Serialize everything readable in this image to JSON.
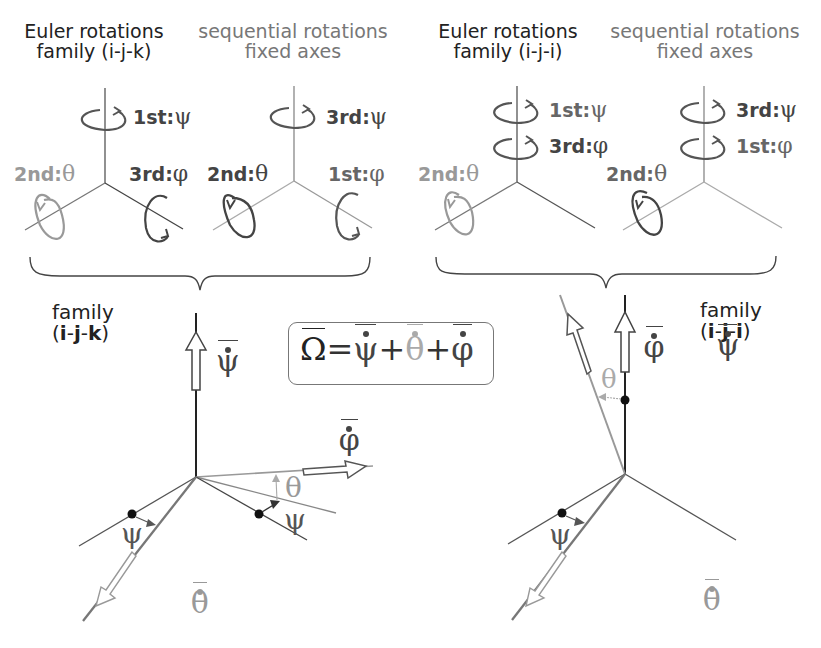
{
  "panels": {
    "ijk_euler": {
      "title_line1": "Euler rotations",
      "title_line2": "family (i-j-k)",
      "rotations": [
        {
          "order": "1st:",
          "angle": "ψ",
          "axis": "vertical"
        },
        {
          "order": "2nd:",
          "angle": "θ",
          "axis": "left"
        },
        {
          "order": "3rd:",
          "angle": "φ",
          "axis": "right"
        }
      ]
    },
    "ijk_fixed": {
      "title_line1": "sequential rotations",
      "title_line2": "fixed axes",
      "rotations": [
        {
          "order": "3rd:",
          "angle": "ψ",
          "axis": "vertical"
        },
        {
          "order": "2nd:",
          "angle": "θ",
          "axis": "left"
        },
        {
          "order": "1st:",
          "angle": "φ",
          "axis": "right"
        }
      ]
    },
    "iji_euler": {
      "title_line1": "Euler rotations",
      "title_line2": "family (i-j-i)",
      "rotations": [
        {
          "order": "1st:",
          "angle": "ψ",
          "axis": "vertical"
        },
        {
          "order": "3rd:",
          "angle": "φ",
          "axis": "vertical"
        },
        {
          "order": "2nd:",
          "angle": "θ",
          "axis": "left"
        }
      ]
    },
    "iji_fixed": {
      "title_line1": "sequential rotations",
      "title_line2": "fixed axes",
      "rotations": [
        {
          "order": "3rd:",
          "angle": "ψ",
          "axis": "vertical"
        },
        {
          "order": "1st:",
          "angle": "φ",
          "axis": "vertical"
        },
        {
          "order": "2nd:",
          "angle": "θ",
          "axis": "left"
        }
      ]
    }
  },
  "bottom": {
    "left_family": {
      "line1": "family",
      "open": "(",
      "i": "i",
      "d1": "-",
      "j": "j",
      "d2": "-",
      "k": "k",
      "close": ")"
    },
    "right_family": {
      "line1": "family",
      "open": "(",
      "i": "i",
      "d1": "-",
      "j": "j",
      "d2": "-",
      "i2": "i",
      "close": ")"
    },
    "left_vectors": {
      "psi_dot": "ψ",
      "phi_dot": "φ",
      "theta_dot": "θ",
      "theta_angle": "θ",
      "psi_angle_left": "ψ",
      "psi_angle_right": "ψ"
    },
    "right_vectors": {
      "psi_dot": "ψ",
      "phi_dot": "φ",
      "theta_dot": "θ",
      "theta_angle": "θ",
      "psi_angle": "ψ"
    },
    "equation": {
      "omega": "Ω",
      "eq": "=",
      "psi": "ψ",
      "plus1": "+",
      "theta": "θ",
      "plus2": "+",
      "phi": "φ"
    }
  },
  "colors": {
    "dark": "#333333",
    "mid": "#666666",
    "light": "#999999",
    "lighter": "#b0b0b0"
  }
}
